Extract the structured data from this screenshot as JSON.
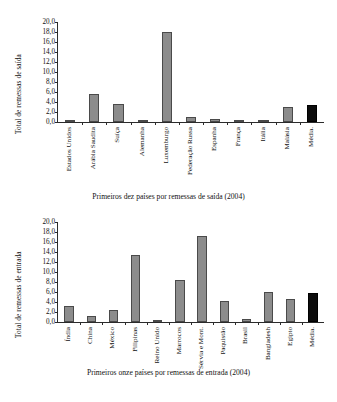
{
  "figure": {
    "background": "#ffffff",
    "bar_color": "#8c8c8c",
    "average_bar_color": "#0c0c0c",
    "axis_color": "#2b2b2b"
  },
  "chart_data": [
    {
      "type": "bar",
      "id": "outward-remittances",
      "title": "",
      "caption": "Primeiros dez países por remessas de saída (2004)",
      "xlabel": "",
      "ylabel": "Total de remessas de saída",
      "ylim": [
        0,
        20
      ],
      "ytick_step": 2,
      "grid": false,
      "legend": null,
      "ytick_labels": [
        "0,0",
        "2,0",
        "4,0",
        "6,0",
        "8,0",
        "10,0",
        "12,0",
        "14,0",
        "16,0",
        "18,0",
        "20,0"
      ],
      "categories": [
        "Estados Unidos",
        "Arábia Saudita",
        "Suíça",
        "Alemanha",
        "Luxemburgo",
        "Federação Russa",
        "Espanha",
        "França",
        "Itália",
        "Malásia",
        "Média."
      ],
      "values": [
        0.4,
        5.6,
        3.7,
        0.5,
        18.0,
        1.0,
        0.7,
        0.3,
        0.3,
        3.1,
        3.4
      ],
      "highlight_index": 10
    },
    {
      "type": "bar",
      "id": "inward-remittances",
      "title": "",
      "caption": "Primeiros onze países por remessas de entrada (2004)",
      "xlabel": "",
      "ylabel": "Total de remessas de entrada",
      "ylim": [
        0,
        20
      ],
      "ytick_step": 2,
      "grid": false,
      "legend": null,
      "ytick_labels": [
        "0,0",
        "2,0",
        "4,0",
        "6,0",
        "8,0",
        "10,0",
        "12,0",
        "14,0",
        "16,0",
        "18,0",
        "20,0"
      ],
      "categories": [
        "Índia",
        "China",
        "México",
        "Filipinas",
        "Reino Unido",
        "Marrocos",
        "Sérvia e Mont.",
        "Paquistão",
        "Brasil",
        "Bangladesh",
        "Egipto",
        "Média."
      ],
      "values": [
        3.2,
        1.2,
        2.5,
        13.5,
        0.3,
        8.5,
        17.3,
        4.2,
        0.7,
        6.1,
        4.6,
        5.8
      ],
      "highlight_index": 11
    }
  ]
}
